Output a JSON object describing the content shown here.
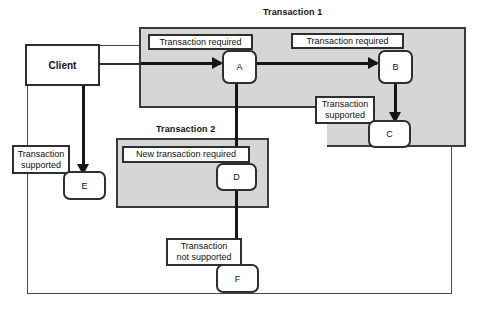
{
  "diagram": {
    "colors": {
      "panel_fill": "#d6d6d6",
      "panel_border": "#3a3a3a",
      "node_fill": "#ffffff",
      "node_border": "#2e2e2e",
      "line": "#151515",
      "background": "#ffffff"
    },
    "panels": [
      {
        "id": "tx1",
        "title": "Transaction 1"
      },
      {
        "id": "tx2",
        "title": "Transaction 2"
      }
    ],
    "client": {
      "label": "Client"
    },
    "nodes": [
      {
        "id": "a",
        "label": "A"
      },
      {
        "id": "b",
        "label": "B"
      },
      {
        "id": "c",
        "label": "C"
      },
      {
        "id": "d",
        "label": "D"
      },
      {
        "id": "e",
        "label": "E"
      },
      {
        "id": "f",
        "label": "F"
      }
    ],
    "labels": {
      "a": "Transaction required",
      "b": "Transaction required",
      "c": "Transaction\nsupported",
      "d": "New transaction required",
      "e": "Transaction\nsupported",
      "f": "Transaction\nnot supported"
    }
  }
}
